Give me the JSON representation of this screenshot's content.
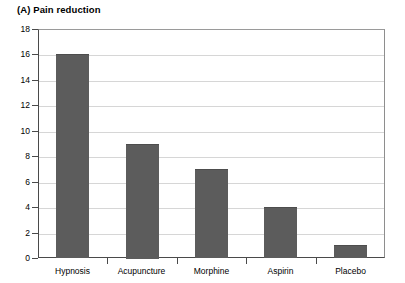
{
  "chart_data": {
    "type": "bar",
    "title": "(A)  Pain reduction",
    "panel_letter": "(A)",
    "xlabel": "",
    "ylabel": "",
    "categories": [
      "Hypnosis",
      "Acupuncture",
      "Morphine",
      "Aspirin",
      "Placebo"
    ],
    "values": [
      16,
      9,
      7,
      4,
      1
    ],
    "series": [
      {
        "name": "Pain reduction",
        "values": [
          16,
          9,
          7,
          4,
          1
        ]
      }
    ],
    "ylim": [
      0,
      18
    ],
    "ytick_step": 2,
    "yticks": [
      18,
      16,
      14,
      12,
      10,
      8,
      6,
      4,
      2,
      0
    ],
    "ytick_labels": [
      "18",
      "16",
      "14",
      "12",
      "10",
      "8",
      "6",
      "4",
      "2",
      "0"
    ],
    "grid": "horizontal",
    "legend": "none",
    "bar_color": "#5c5c5c",
    "grid_color": "#d6d6d6",
    "axis_color": "#4a4a4a",
    "background": "#ffffff"
  }
}
